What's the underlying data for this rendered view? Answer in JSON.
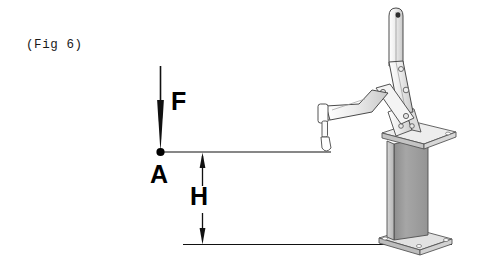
{
  "figure": {
    "caption": "(Fig 6)",
    "background_color": "#ffffff",
    "width": 479,
    "height": 263
  },
  "labels": {
    "force": "F",
    "point": "A",
    "height": "H"
  },
  "annotations": {
    "force_arrow": {
      "name": "F",
      "meaning": "applied force",
      "direction": "down",
      "tip_x": 160,
      "tip_y": 152
    },
    "point_a": {
      "name": "A",
      "meaning": "point of force application",
      "x": 160,
      "y": 152
    },
    "height_dimension": {
      "name": "H",
      "meaning": "height from base to point A level",
      "x": 202,
      "top_y": 154,
      "bottom_y": 244
    },
    "upper_reference_line": {
      "y": 152,
      "x_start": 160,
      "x_end": 331
    },
    "lower_reference_line": {
      "y": 244,
      "x_start": 183,
      "x_end": 452
    }
  },
  "device": {
    "name": "vertical toggle clamp on pedestal",
    "colors": {
      "outline": "#4a4a4a",
      "metal_light": "#f2f2f2",
      "metal_mid": "#cfcfcf",
      "column_face": "#9d9d9d",
      "column_side": "#c2c2c2",
      "plate_top": "#e8e8e8",
      "spindle_tip": "#ffffff"
    },
    "parts": [
      "handle",
      "upper-link",
      "pivot-rivets",
      "clamp-arm",
      "spindle-tip",
      "base-bracket",
      "top-mounting-plate",
      "pedestal-column",
      "bottom-base-plate"
    ]
  }
}
